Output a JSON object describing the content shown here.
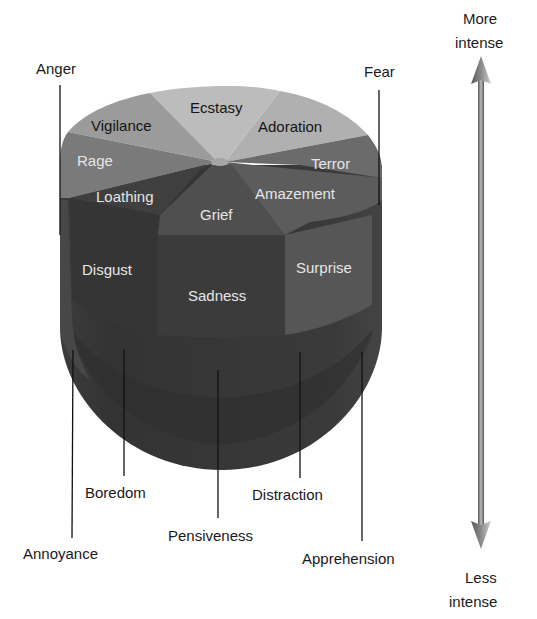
{
  "colors": {
    "background": "#ffffff",
    "ecstasy": "#b9b9b9",
    "adoration": "#b3b3b3",
    "vigilance": "#9a9a9a",
    "terror": "#6e6e6e",
    "rage": "#7a7a7a",
    "amazement": "#5f5f5f",
    "loathing": "#3e3e3e",
    "grief": "#505050",
    "body_outer": "#343434",
    "body_mid": "#444444",
    "sadness": "#3a3a3a",
    "surprise": "#555555",
    "text_light": "#e6e6e6",
    "text_dark": "#151515"
  },
  "top_labels": {
    "anger": "Anger",
    "fear": "Fear"
  },
  "cap_segments": {
    "ecstasy": "Ecstasy",
    "adoration": "Adoration",
    "vigilance": "Vigilance",
    "terror": "Terror",
    "rage": "Rage",
    "amazement": "Amazement",
    "loathing": "Loathing",
    "grief": "Grief"
  },
  "middle_labels": {
    "disgust": "Disgust",
    "sadness": "Sadness",
    "surprise": "Surprise"
  },
  "bottom_labels": {
    "annoyance": "Annoyance",
    "boredom": "Boredom",
    "pensiveness": "Pensiveness",
    "distraction": "Distraction",
    "apprehension": "Apprehension"
  },
  "intensity_axis": {
    "top_line1": "More",
    "top_line2": "intense",
    "bottom_line1": "Less",
    "bottom_line2": "intense"
  }
}
